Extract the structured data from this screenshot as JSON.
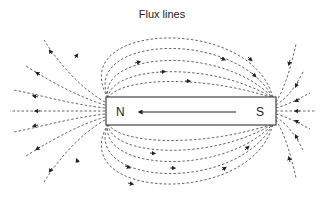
{
  "diagram": {
    "title": "Flux lines",
    "magnet": {
      "north_label": "N",
      "south_label": "S",
      "arrow_direction": "S-to-N (inside magnet)"
    },
    "field_direction_outside": "N-to-S",
    "colors": {
      "lines": "#555555",
      "magnet_border": "#444444",
      "background": "#ffffff"
    }
  }
}
